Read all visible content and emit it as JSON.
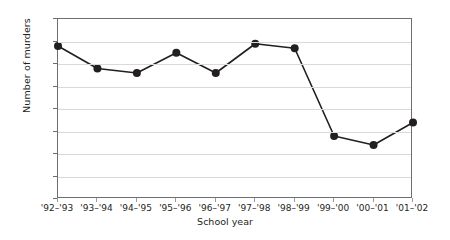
{
  "chart_data": {
    "type": "line",
    "title": "",
    "xlabel": "School year",
    "ylabel": "Number of murders",
    "categories": [
      "'92–'93",
      "'93–'94",
      "'94–'95",
      "'95–'96",
      "'96–'97",
      "'97–'98",
      "'98–'99",
      "'99–'00",
      "'00–'01",
      "'01–'02"
    ],
    "values": [
      34,
      29,
      28,
      32.5,
      28,
      34.5,
      33.5,
      14,
      12,
      17
    ],
    "ylim": [
      0,
      40
    ],
    "ytick_values": [
      0,
      5,
      10,
      15,
      20,
      25,
      30,
      35,
      40
    ],
    "ytick_labels": [
      "0",
      "5",
      "10",
      "15",
      "20",
      "25",
      "30",
      "35",
      "40"
    ],
    "grid": "horizontal",
    "legend": "none",
    "marker": "filled-circle",
    "line_color": "#231f20",
    "marker_color": "#231f20",
    "grid_color": "#d9d9d9",
    "axis_color": "#6d6e71"
  }
}
